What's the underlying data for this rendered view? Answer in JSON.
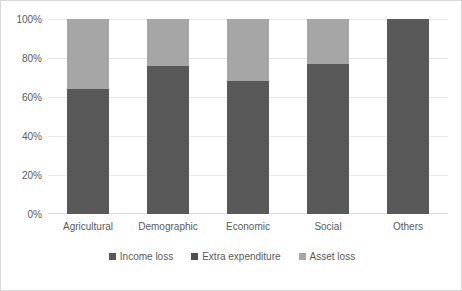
{
  "chart_data": {
    "type": "bar",
    "subtype": "100% stacked column",
    "title": "",
    "xlabel": "",
    "ylabel": "",
    "categories": [
      "Agricultural",
      "Demographic",
      "Economic",
      "Social",
      "Others"
    ],
    "series": [
      {
        "name": "Income loss",
        "color": "#595959",
        "values": [
          64,
          76,
          68,
          77,
          100
        ]
      },
      {
        "name": "Extra expenditure",
        "color": "#4f4f4f",
        "values": [
          0,
          0,
          0,
          0,
          0
        ]
      },
      {
        "name": "Asset loss",
        "color": "#a6a6a6",
        "values": [
          36,
          24,
          32,
          23,
          0
        ]
      }
    ],
    "ylim": [
      0,
      100
    ],
    "yticks": [
      0,
      20,
      40,
      60,
      80,
      100
    ],
    "ytick_labels": [
      "0%",
      "20%",
      "40%",
      "60%",
      "80%",
      "100%"
    ],
    "grid": true,
    "legend_position": "bottom"
  },
  "axis": {
    "y_labels": [
      "100%",
      "80%",
      "60%",
      "40%",
      "20%",
      "0%"
    ],
    "x_labels": [
      "Agricultural",
      "Demographic",
      "Economic",
      "Social",
      "Others"
    ]
  },
  "legend": {
    "items": [
      {
        "label": "Income loss",
        "color": "#595959"
      },
      {
        "label": "Extra expenditure",
        "color": "#4f4f4f"
      },
      {
        "label": "Asset loss",
        "color": "#a6a6a6"
      }
    ]
  },
  "colors": {
    "income_loss": "#595959",
    "extra_expenditure": "#4f4f4f",
    "asset_loss": "#a6a6a6",
    "gridline": "#e8e8e8",
    "border": "#d9d9d9",
    "text": "#5a5a5a"
  }
}
